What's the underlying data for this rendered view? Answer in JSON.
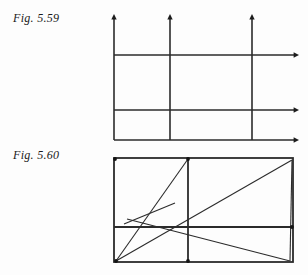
{
  "page": {
    "width": 308,
    "height": 275,
    "background_color": "#fdfdfd",
    "ink_color": "#2b2b2b"
  },
  "figures": [
    {
      "id": "fig-5-59",
      "label": "Fig. 5.59",
      "label_position": {
        "x": 13,
        "y": 11
      },
      "description": "Three parallel vertical rays with upward arrowheads crossed by three parallel horizontal rays with rightward arrowheads",
      "geometry": {
        "vertical_rays": [
          {
            "name": "vertical-ray-left",
            "x": 114,
            "y_top": 14,
            "y_bottom": 140,
            "arrow": "up"
          },
          {
            "name": "vertical-ray-middle",
            "x": 170,
            "y_top": 14,
            "y_bottom": 140,
            "arrow": "up"
          },
          {
            "name": "vertical-ray-right",
            "x": 252,
            "y_top": 14,
            "y_bottom": 140,
            "arrow": "up"
          }
        ],
        "horizontal_rays": [
          {
            "name": "horizontal-ray-upper",
            "y": 55,
            "x_left": 114,
            "x_right": 299,
            "arrow": "right"
          },
          {
            "name": "horizontal-ray-middle",
            "y": 110,
            "x_left": 114,
            "x_right": 299,
            "arrow": "right"
          },
          {
            "name": "horizontal-ray-lower",
            "y": 140,
            "x_left": 114,
            "x_right": 299,
            "arrow": "right"
          }
        ]
      }
    },
    {
      "id": "fig-5-60",
      "label": "Fig. 5.60",
      "label_position": {
        "x": 13,
        "y": 148
      },
      "description": "Rectangle divided by one vertical and one horizontal interior line, with several diagonal chords drawn across it",
      "geometry": {
        "rectangle": {
          "name": "outer-rectangle",
          "x_left": 114,
          "x_right": 293,
          "y_top": 158,
          "y_bottom": 262
        },
        "interior_lines": [
          {
            "name": "interior-vertical",
            "x": 188,
            "y_top": 158,
            "y_bottom": 262
          },
          {
            "name": "interior-horizontal",
            "y": 227,
            "x_left": 114,
            "x_right": 293
          }
        ],
        "diagonals": [
          {
            "name": "diagonal-bottomleft-to-topmiddle",
            "x1": 116,
            "y1": 261,
            "x2": 188,
            "y2": 159
          },
          {
            "name": "diagonal-bottomleft-to-topright",
            "x1": 116,
            "y1": 261,
            "x2": 292,
            "y2": 160
          },
          {
            "name": "diagonal-topright-to-bottomright",
            "x1": 292,
            "y1": 160,
            "x2": 290,
            "y2": 261
          },
          {
            "name": "diagonal-midleft-to-bottomright",
            "x1": 127,
            "y1": 219,
            "x2": 290,
            "y2": 261
          },
          {
            "name": "short-chord-crossing",
            "x1": 124,
            "y1": 224,
            "x2": 175,
            "y2": 203
          }
        ],
        "corner_nodes": [
          {
            "name": "node-top-left",
            "x": 115,
            "y": 159
          },
          {
            "name": "node-top-middle",
            "x": 188,
            "y": 159
          },
          {
            "name": "node-bottom-left",
            "x": 116,
            "y": 261
          },
          {
            "name": "node-bottom-middle",
            "x": 188,
            "y": 261
          },
          {
            "name": "node-right-middle",
            "x": 292,
            "y": 227
          }
        ]
      }
    }
  ]
}
